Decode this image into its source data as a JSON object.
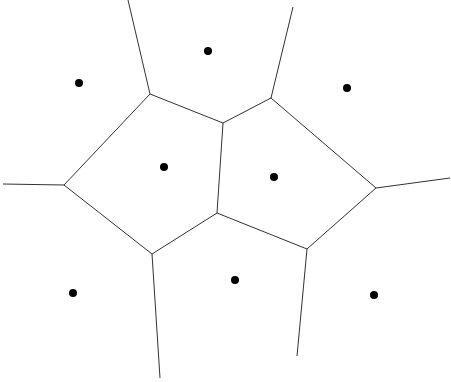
{
  "diagram": {
    "type": "voronoi",
    "width": 451,
    "height": 382,
    "background": "#ffffff",
    "line_color": "#333333",
    "point_color": "#000000",
    "sites": [
      {
        "x": 79,
        "y": 83
      },
      {
        "x": 208,
        "y": 51
      },
      {
        "x": 347,
        "y": 88
      },
      {
        "x": 164,
        "y": 167
      },
      {
        "x": 274,
        "y": 177
      },
      {
        "x": 73,
        "y": 293
      },
      {
        "x": 235,
        "y": 280
      },
      {
        "x": 374,
        "y": 295
      }
    ],
    "edges": [
      [
        128,
        0,
        150,
        94
      ],
      [
        293,
        7,
        271,
        98
      ],
      [
        150,
        94,
        223,
        123
      ],
      [
        223,
        123,
        271,
        98
      ],
      [
        150,
        94,
        64,
        185
      ],
      [
        3,
        184,
        64,
        185
      ],
      [
        64,
        185,
        152,
        254
      ],
      [
        223,
        123,
        217,
        213
      ],
      [
        271,
        98,
        376,
        188
      ],
      [
        376,
        188,
        450,
        178
      ],
      [
        376,
        188,
        307,
        249
      ],
      [
        217,
        213,
        152,
        254
      ],
      [
        217,
        213,
        307,
        249
      ],
      [
        152,
        254,
        160,
        378
      ],
      [
        307,
        249,
        297,
        356
      ]
    ]
  }
}
